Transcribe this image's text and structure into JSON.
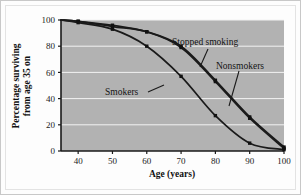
{
  "chart_data": {
    "type": "line",
    "title": "",
    "xlabel": "Age (years)",
    "ylabel": "Percentage surviving from age 35 on",
    "ylabel_line1": "Percentage surviving",
    "ylabel_line2": "from age 35 on",
    "xlim": [
      35,
      100
    ],
    "ylim": [
      0,
      100
    ],
    "grid": "horizontal",
    "legend": "inline-annotations",
    "xticks": [
      40,
      50,
      60,
      70,
      80,
      90,
      100
    ],
    "yticks": [
      0,
      20,
      40,
      60,
      80,
      100
    ],
    "x": [
      35,
      40,
      50,
      60,
      70,
      80,
      90,
      100
    ],
    "series": [
      {
        "name": "Nonsmokers",
        "label": "Nonsmokers",
        "values": [
          100,
          99,
          96,
          91,
          80,
          54,
          26,
          3
        ]
      },
      {
        "name": "Stopped smoking",
        "label": "Stopped smoking",
        "values": [
          100,
          99,
          95,
          91,
          79,
          53,
          25,
          2
        ]
      },
      {
        "name": "Smokers",
        "label": "Smokers",
        "values": [
          100,
          98,
          93,
          80,
          57,
          27,
          6,
          1
        ]
      }
    ],
    "annotations": [
      {
        "text": "Stopped smoking",
        "x": 78,
        "y": 88
      },
      {
        "text": "Nonsmokers",
        "x": 88,
        "y": 65
      },
      {
        "text": "Smokers",
        "x": 58,
        "y": 42
      }
    ],
    "colors": {
      "plot_background": "#b2b2b2",
      "gridline": "#f2f2f2",
      "curve": "#1a1a1a",
      "marker": "#111111",
      "axis": "#1a1a1a",
      "figure_background": "#fdfdfd",
      "text": "#141414"
    }
  }
}
